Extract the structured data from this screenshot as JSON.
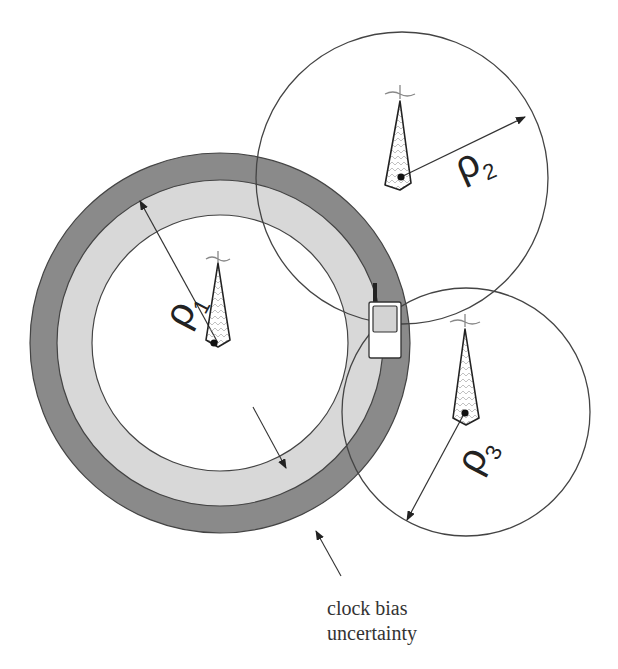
{
  "diagram": {
    "colors": {
      "background": "#ffffff",
      "outer_ring": "#8a8a8a",
      "inner_ring": "#d6d6d6",
      "stroke": "#333333",
      "text": "#222222"
    },
    "towers": [
      {
        "id": "tower-1",
        "range_label": "ρ",
        "range_subscript": "1"
      },
      {
        "id": "tower-2",
        "range_label": "ρ",
        "range_subscript": "2"
      },
      {
        "id": "tower-3",
        "range_label": "ρ",
        "range_subscript": "3"
      }
    ],
    "annotation": {
      "line1": "clock bias",
      "line2": "uncertainty"
    }
  }
}
